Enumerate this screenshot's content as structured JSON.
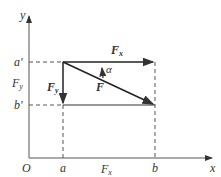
{
  "diagram": {
    "axes": {
      "x_label": "x",
      "y_label": "y",
      "origin_label": "O"
    },
    "x_points": [
      {
        "label": "a"
      },
      {
        "label": "b"
      }
    ],
    "y_points": [
      {
        "label": "a'"
      },
      {
        "label": "b'"
      }
    ],
    "vectors": {
      "F": {
        "label": "F"
      },
      "Fx": {
        "label": "F",
        "sub": "x"
      },
      "Fy": {
        "label": "F",
        "sub": "y"
      }
    },
    "projections": {
      "Fx_axis": {
        "label": "F",
        "sub": "x"
      },
      "Fy_axis": {
        "label": "F",
        "sub": "y"
      }
    },
    "angle": {
      "label": "α"
    },
    "colors": {
      "line": "#333333",
      "dashed": "#555555"
    }
  }
}
